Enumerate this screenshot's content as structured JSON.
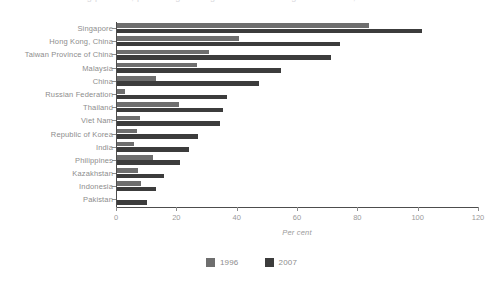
{
  "title_sliver": "ing partners, percentage change in manufacturing value added, 1996 and 2007",
  "legend": {
    "position": "bottom-center",
    "entries": [
      {
        "label": "1996",
        "color": "#6e6e6e"
      },
      {
        "label": "2007",
        "color": "#3c3c3c"
      }
    ]
  },
  "axis": {
    "xlabel": "Per cent",
    "ticks": [
      "0",
      "20",
      "40",
      "60",
      "80",
      "100",
      "120"
    ]
  },
  "chart_data": {
    "type": "bar",
    "orientation": "horizontal",
    "title": "",
    "xlabel": "Per cent",
    "ylabel": "",
    "xlim": [
      0,
      120
    ],
    "xticks": [
      0,
      20,
      40,
      60,
      80,
      100,
      120
    ],
    "grid": false,
    "legend_position": "bottom-center",
    "categories": [
      "Singapore",
      "Hong Kong, China",
      "Taiwan Province of China",
      "Malaysia",
      "China",
      "Russian Federation",
      "Thailand",
      "Viet Nam",
      "Republic of Korea",
      "India",
      "Philippines",
      "Kazakhstan",
      "Indonesia",
      "Pakistan"
    ],
    "series": [
      {
        "name": "1996",
        "color": "#6e6e6e",
        "values": [
          83.5,
          40.5,
          30.5,
          26.5,
          13.0,
          2.5,
          20.5,
          7.5,
          6.5,
          5.5,
          12.0,
          7.0,
          8.0,
          0.0
        ]
      },
      {
        "name": "2007",
        "color": "#3c3c3c",
        "values": [
          101.0,
          74.0,
          71.0,
          54.5,
          47.0,
          36.5,
          35.0,
          34.0,
          27.0,
          24.0,
          21.0,
          15.5,
          13.0,
          10.0
        ]
      }
    ]
  }
}
